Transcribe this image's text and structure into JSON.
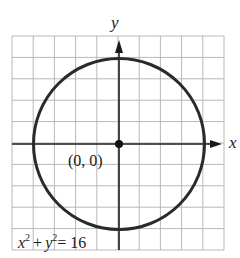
{
  "figure": {
    "x_axis_label": "x",
    "y_axis_label": "y",
    "center_label": "(0, 0)",
    "equation": {
      "x_term": "x",
      "x_exp": "2",
      "plus": "+",
      "y_term": "y",
      "y_exp": "2",
      "rhs": "= 16"
    },
    "grid": {
      "x_min": -5,
      "x_max": 5,
      "y_min": -5,
      "y_max": 5,
      "step": 1
    },
    "circle": {
      "center": [
        0,
        0
      ],
      "radius": 4
    },
    "colors": {
      "grid": "#b8b8b8",
      "axis": "#1a1a1a",
      "curve": "#2a2a2a",
      "background": "#ffffff"
    }
  }
}
